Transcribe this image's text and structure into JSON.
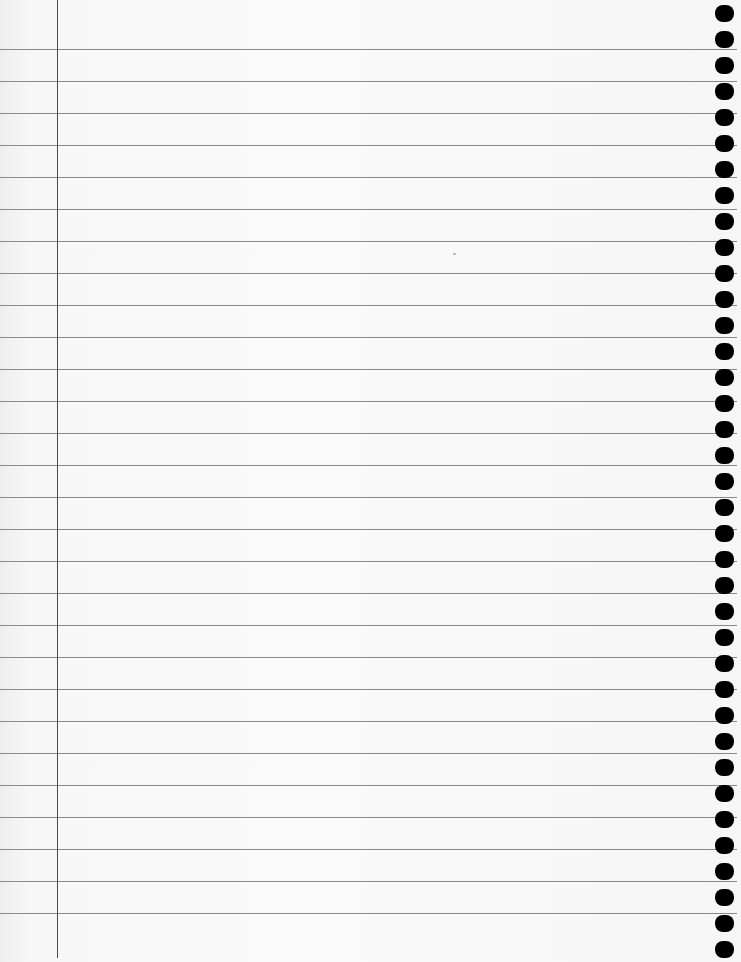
{
  "page": {
    "type": "blank-lined-notebook-page",
    "background_color": "#f7f7f7",
    "rule_color": "#8a8a8a",
    "margin_color": "#4a4a4a",
    "hole_color": "#000000"
  },
  "rules": {
    "count": 28,
    "first_y": 49,
    "spacing": 32,
    "right_end_x": 737
  },
  "margin": {
    "x": 57,
    "bottom_y": 958
  },
  "holes": {
    "count": 37,
    "first_center_y": 13,
    "spacing": 26,
    "center_x": 724
  },
  "content": {
    "text_lines": []
  }
}
